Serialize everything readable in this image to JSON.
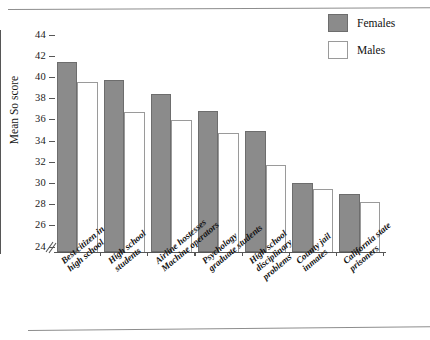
{
  "chart_data": {
    "type": "bar",
    "title": "",
    "xlabel": "",
    "ylabel": "Mean So score",
    "ylim": [
      23,
      45
    ],
    "ybreak": 24,
    "yticks": [
      24,
      26,
      28,
      30,
      32,
      34,
      36,
      38,
      40,
      42,
      44
    ],
    "ytick_labels": [
      "24",
      "26",
      "28",
      "30",
      "32",
      "34",
      "36",
      "38",
      "40",
      "42",
      "44"
    ],
    "grid": false,
    "legend_position": "top-right",
    "categories": [
      "Best citizen in\nhigh school",
      "High school\nstudents",
      "Airline hostesses\nMachine operators",
      "Psychology\ngraduate students",
      "High school\ndisciplinary\nproblems",
      "County jail\ninmates",
      "California state\nprisoners"
    ],
    "series": [
      {
        "name": "Females",
        "color": "#8b8b8b",
        "values": [
          41.5,
          39.8,
          38.4,
          36.8,
          34.9,
          30.0,
          29.0
        ]
      },
      {
        "name": "Males",
        "color": "#ffffff",
        "values": [
          39.6,
          36.7,
          36.0,
          34.8,
          31.7,
          29.5,
          28.2
        ]
      }
    ]
  },
  "legend": {
    "items": [
      {
        "label": "Females",
        "swatch": "female"
      },
      {
        "label": "Males",
        "swatch": "male"
      }
    ]
  },
  "axis": {
    "y_label": "Mean So score",
    "break_icon": "axis-break-slashes"
  }
}
